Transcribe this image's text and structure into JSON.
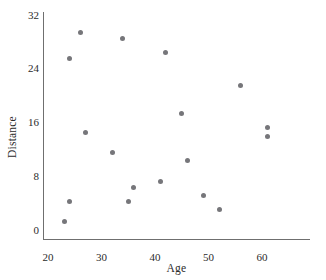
{
  "chart_data": {
    "type": "scatter",
    "title": "",
    "xlabel": "Age",
    "ylabel": "Distance",
    "xlim": [
      18,
      68
    ],
    "ylim": [
      0,
      32
    ],
    "xticks": [
      20,
      30,
      40,
      50,
      60
    ],
    "yticks": [
      0,
      8,
      16,
      24,
      32
    ],
    "grid": false,
    "legend": null,
    "marker": {
      "shape": "circle",
      "color": "#76767a",
      "size": 5
    },
    "axis_color": "#6f6f6f",
    "points": [
      {
        "x": 23,
        "y": 1.3
      },
      {
        "x": 24,
        "y": 4.3
      },
      {
        "x": 24,
        "y": 25.6
      },
      {
        "x": 26,
        "y": 29.5
      },
      {
        "x": 27,
        "y": 14.5
      },
      {
        "x": 32,
        "y": 11.5
      },
      {
        "x": 34,
        "y": 28.5
      },
      {
        "x": 35,
        "y": 4.3
      },
      {
        "x": 36,
        "y": 6.3
      },
      {
        "x": 41,
        "y": 7.3
      },
      {
        "x": 42,
        "y": 26.5
      },
      {
        "x": 45,
        "y": 17.3
      },
      {
        "x": 46,
        "y": 10.3
      },
      {
        "x": 49,
        "y": 5.2
      },
      {
        "x": 52,
        "y": 3.1
      },
      {
        "x": 56,
        "y": 21.6
      },
      {
        "x": 61,
        "y": 15.3
      },
      {
        "x": 61,
        "y": 14.0
      }
    ]
  },
  "axes": {
    "x_tick_labels": [
      "20",
      "30",
      "40",
      "50",
      "60"
    ],
    "y_tick_labels": [
      "0",
      "8",
      "16",
      "24",
      "32"
    ],
    "x_title": "Age",
    "y_title": "Distance"
  }
}
